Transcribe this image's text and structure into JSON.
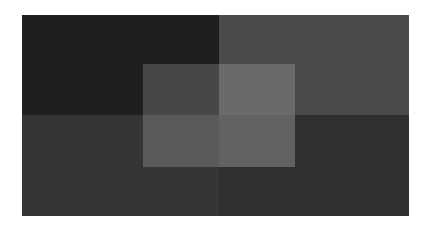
{
  "canvas": {
    "background": "#ffffff"
  },
  "quadrants": [
    {
      "name": "top-left",
      "color": "#1f1f1f",
      "x": 22,
      "y": 15,
      "w": 197,
      "h": 100
    },
    {
      "name": "top-right",
      "color": "#4a4a4a",
      "x": 219,
      "y": 15,
      "w": 190,
      "h": 100
    },
    {
      "name": "bottom-left",
      "color": "#353535",
      "x": 22,
      "y": 115,
      "w": 197,
      "h": 101
    },
    {
      "name": "bottom-right",
      "color": "#2f2f2f",
      "x": 219,
      "y": 115,
      "w": 190,
      "h": 101
    }
  ],
  "inner_overlay": {
    "cells": [
      {
        "name": "inner-top-left",
        "color": "#474747",
        "x": 143,
        "y": 64,
        "w": 76,
        "h": 51
      },
      {
        "name": "inner-top-right",
        "color": "#6a6a6a",
        "x": 219,
        "y": 64,
        "w": 76,
        "h": 51
      },
      {
        "name": "inner-bottom-left",
        "color": "#5a5a5a",
        "x": 143,
        "y": 115,
        "w": 76,
        "h": 52
      },
      {
        "name": "inner-bottom-right",
        "color": "#626262",
        "x": 219,
        "y": 115,
        "w": 76,
        "h": 52
      }
    ]
  }
}
